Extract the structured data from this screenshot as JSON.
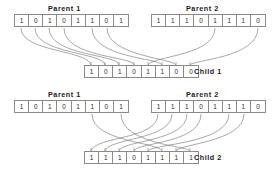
{
  "diagram": {
    "bit_count": 8,
    "line_color": "#6e6e6e",
    "box_border_color": "#8a8a8a",
    "text_color": "#1a1a1a",
    "background": "#ffffff",
    "blocks": [
      {
        "parent1": {
          "label": "Parent 1",
          "bits": [
            "1",
            "0",
            "1",
            "0",
            "1",
            "1",
            "0",
            "1"
          ]
        },
        "parent2": {
          "label": "Parent 2",
          "bits": [
            "1",
            "1",
            "1",
            "0",
            "1",
            "1",
            "1",
            "0"
          ]
        },
        "child": {
          "label": "Child 1",
          "bits": [
            "1",
            "0",
            "1",
            "0",
            "1",
            "1",
            "0",
            "0"
          ],
          "sources": [
            "p1",
            "p1",
            "p1",
            "p1",
            "p2",
            "p1",
            "p1",
            "p2"
          ]
        }
      },
      {
        "parent1": {
          "label": "Parent 1",
          "bits": [
            "1",
            "0",
            "1",
            "0",
            "1",
            "1",
            "0",
            "1"
          ]
        },
        "parent2": {
          "label": "Parent 2",
          "bits": [
            "1",
            "1",
            "1",
            "0",
            "1",
            "1",
            "1",
            "0"
          ]
        },
        "child": {
          "label": "Child 2",
          "bits": [
            "1",
            "1",
            "1",
            "0",
            "1",
            "1",
            "1",
            "1"
          ],
          "sources": [
            "p2",
            "p2",
            "p2",
            "p2",
            "p1",
            "p2",
            "p2",
            "p1"
          ]
        }
      }
    ]
  }
}
